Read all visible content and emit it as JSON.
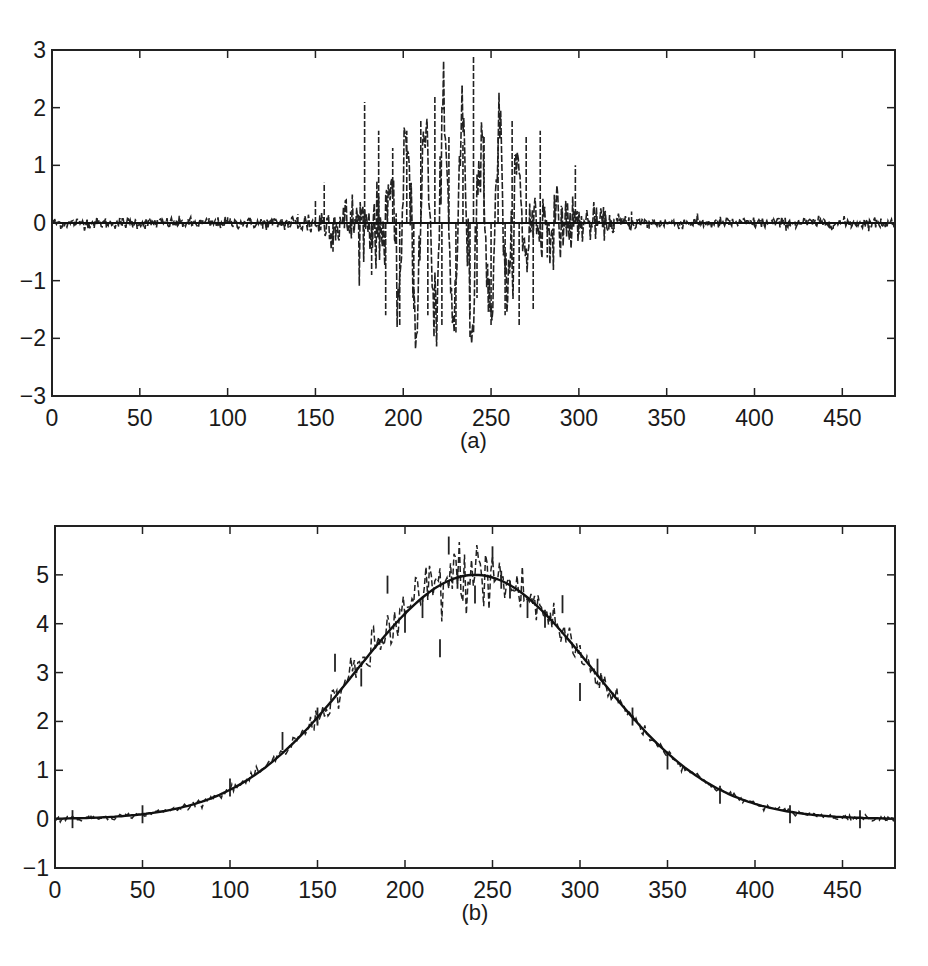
{
  "chart_data": [
    {
      "id": "a",
      "type": "line",
      "caption": "(a)",
      "title": "",
      "xlabel": "",
      "ylabel": "",
      "xlim": [
        0,
        480
      ],
      "ylim": [
        -3,
        3
      ],
      "xticks": [
        0,
        50,
        100,
        150,
        200,
        250,
        300,
        350,
        400,
        450
      ],
      "yticks": [
        -3,
        -2,
        -1,
        0,
        1,
        2,
        3
      ],
      "grid": false,
      "legend": null,
      "description": "Noisy oscillating burst centered near x=240 (approx. 180-280) with amplitude up to ~2.9; near-zero with small noise elsewhere; solid baseline at y=0",
      "series": [
        {
          "name": "noisy signal",
          "style": "dashed",
          "x": [
            0,
            20,
            40,
            60,
            80,
            100,
            120,
            140,
            150,
            155,
            160,
            170,
            178,
            182,
            186,
            190,
            194,
            198,
            202,
            206,
            210,
            214,
            218,
            222,
            226,
            230,
            234,
            238,
            240,
            242,
            246,
            250,
            254,
            258,
            262,
            266,
            270,
            274,
            278,
            282,
            290,
            298,
            300,
            310,
            320,
            330,
            340,
            360,
            380,
            400,
            420,
            440,
            460,
            480
          ],
          "y": [
            0,
            0.05,
            -0.05,
            0.05,
            -0.05,
            0.1,
            -0.1,
            0.15,
            0.4,
            0.7,
            -0.5,
            0.2,
            2.1,
            -0.9,
            1.6,
            -1.6,
            1.3,
            -1.8,
            1.6,
            -1.5,
            1.8,
            -1.6,
            2.2,
            -1.8,
            1.5,
            -1.9,
            1.4,
            -1.6,
            2.9,
            -1.3,
            1.5,
            -1.8,
            1.5,
            -1.6,
            1.8,
            -1.8,
            1.5,
            -1.5,
            1.6,
            -0.6,
            0.3,
            1.0,
            -0.2,
            0.15,
            -0.15,
            0.2,
            -0.1,
            0.05,
            -0.05,
            0.05,
            -0.05,
            0.03,
            0,
            0
          ]
        },
        {
          "name": "baseline",
          "style": "solid",
          "x": [
            0,
            480
          ],
          "y": [
            0,
            0
          ]
        }
      ]
    },
    {
      "id": "b",
      "type": "line",
      "caption": "(b)",
      "title": "",
      "xlabel": "",
      "ylabel": "",
      "xlim": [
        0,
        480
      ],
      "ylim": [
        -1,
        6
      ],
      "xticks": [
        0,
        50,
        100,
        150,
        200,
        250,
        300,
        350,
        400,
        450
      ],
      "yticks": [
        -1,
        0,
        1,
        2,
        3,
        4,
        5
      ],
      "grid": false,
      "legend": null,
      "description": "Gaussian envelope (solid) peaking at 5 near x=240 with noisy dashed estimate scattered around it, noisier near the peak",
      "series": [
        {
          "name": "gaussian envelope",
          "style": "solid",
          "x": [
            0,
            25,
            50,
            75,
            100,
            125,
            150,
            175,
            200,
            225,
            240,
            255,
            280,
            305,
            330,
            355,
            380,
            405,
            430,
            455,
            480
          ],
          "y": [
            0.01,
            0.04,
            0.1,
            0.25,
            0.6,
            1.18,
            2.08,
            3.16,
            4.2,
            4.88,
            5.0,
            4.88,
            4.2,
            3.16,
            2.08,
            1.18,
            0.6,
            0.25,
            0.1,
            0.04,
            0.01
          ]
        },
        {
          "name": "noisy estimate",
          "style": "dashed",
          "x": [
            10,
            50,
            100,
            130,
            150,
            160,
            175,
            190,
            200,
            210,
            220,
            225,
            230,
            240,
            250,
            255,
            260,
            270,
            280,
            290,
            300,
            310,
            330,
            350,
            380,
            420,
            460
          ],
          "y": [
            0.0,
            0.1,
            0.65,
            1.6,
            2.1,
            3.2,
            2.9,
            4.8,
            4.0,
            4.3,
            3.5,
            5.6,
            4.9,
            4.6,
            5.4,
            4.9,
            4.7,
            4.3,
            4.1,
            4.4,
            2.6,
            3.1,
            2.1,
            1.2,
            0.5,
            0.1,
            0.0
          ]
        }
      ]
    }
  ]
}
